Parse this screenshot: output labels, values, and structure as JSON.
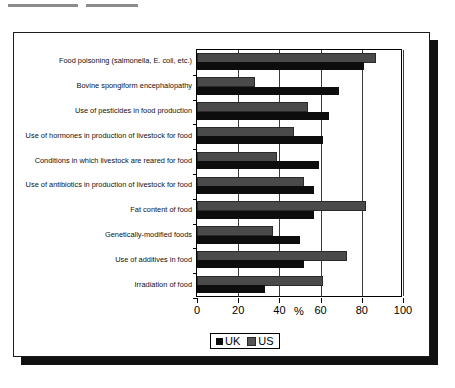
{
  "figure": {
    "x_axis_title": "%",
    "legend": [
      {
        "label": "UK",
        "color": "#0d0d0d"
      },
      {
        "label": "US",
        "color": "#555555"
      }
    ]
  },
  "chart_data": {
    "type": "bar",
    "orientation": "horizontal",
    "title": "",
    "xlabel": "%",
    "ylabel": "",
    "xlim": [
      0,
      100
    ],
    "xticks": [
      0,
      20,
      40,
      60,
      80,
      100
    ],
    "grid": true,
    "legend_position": "bottom",
    "categories": [
      "Food poisoning (salmonella, E. coli, etc.)",
      "Bovine spongiform encephalopathy",
      "Use of pesticides in food production",
      "Use of hormones in production of livestock for food",
      "Conditions in which livestock are reared for food",
      "Use of antibiotics in production of livestock for food",
      "Fat content of food",
      "Genetically-modified foods",
      "Use of additives in food",
      "Irradiation of food"
    ],
    "series": [
      {
        "name": "UK",
        "color": "#0d0d0d",
        "values": [
          81,
          69,
          64,
          61,
          59,
          57,
          57,
          50,
          52,
          33
        ]
      },
      {
        "name": "US",
        "color": "#555555",
        "values": [
          86,
          27,
          53,
          46,
          38,
          51,
          81,
          36,
          72,
          60
        ]
      }
    ]
  }
}
